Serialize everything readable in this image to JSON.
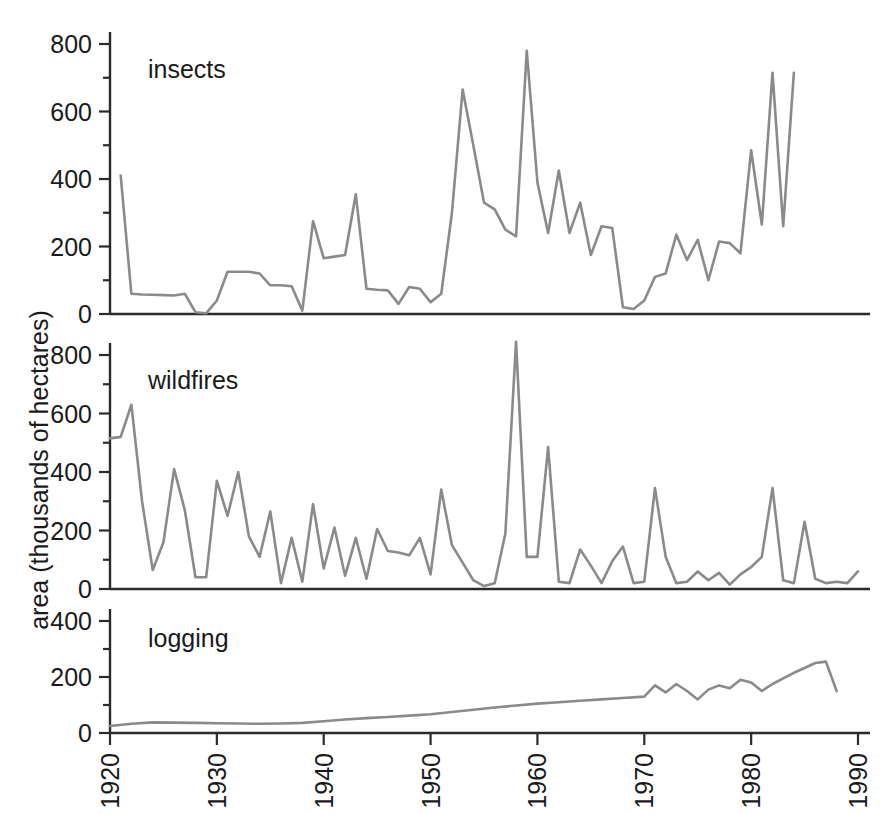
{
  "figure": {
    "y_axis_title": "area (thousands of hectares)",
    "line_color": "#8a8a8a",
    "axis_color": "#2b2b2b",
    "background": "#ffffff"
  },
  "chart_data": {
    "type": "line",
    "title": "",
    "xlabel": "",
    "ylabel": "area (thousands of hectares)",
    "grid": false,
    "legend": "none",
    "xlim": [
      1920,
      1990
    ],
    "x_ticks": [
      "1920",
      "1930",
      "1940",
      "1950",
      "1960",
      "1970",
      "1980",
      "1990"
    ],
    "x_tick_values": [
      1920,
      1930,
      1940,
      1950,
      1960,
      1970,
      1980,
      1990
    ],
    "panels": [
      {
        "name": "insects",
        "label": "insects",
        "ylim": [
          0,
          850
        ],
        "y_ticks": [
          0,
          200,
          400,
          600,
          800
        ],
        "y_tick_labels": [
          "0",
          "200",
          "400",
          "600",
          "800"
        ],
        "y_minor_ticks": [
          100,
          300,
          500,
          700
        ],
        "x": [
          1921,
          1922,
          1923,
          1924,
          1925,
          1926,
          1927,
          1928,
          1929,
          1930,
          1931,
          1932,
          1933,
          1934,
          1935,
          1936,
          1937,
          1938,
          1939,
          1940,
          1941,
          1942,
          1943,
          1944,
          1945,
          1946,
          1947,
          1948,
          1949,
          1950,
          1951,
          1952,
          1953,
          1954,
          1955,
          1956,
          1957,
          1958,
          1959,
          1960,
          1961,
          1962,
          1963,
          1964,
          1965,
          1966,
          1967,
          1968,
          1969,
          1970,
          1971,
          1972,
          1973,
          1974,
          1975,
          1976,
          1977,
          1978,
          1979,
          1980,
          1981,
          1982,
          1983,
          1984,
          1985,
          1986,
          1987,
          1988
        ],
        "values": [
          410,
          60,
          58,
          57,
          56,
          55,
          60,
          5,
          2,
          40,
          125,
          125,
          125,
          120,
          85,
          85,
          82,
          10,
          275,
          165,
          170,
          175,
          355,
          75,
          72,
          70,
          30,
          80,
          75,
          35,
          60,
          300,
          665,
          500,
          330,
          310,
          250,
          230,
          780,
          390,
          240,
          425,
          240,
          330,
          175,
          260,
          255,
          20,
          15,
          40,
          110,
          120,
          235,
          160,
          220,
          100,
          215,
          210,
          180,
          485,
          265,
          715,
          260,
          715
        ]
      },
      {
        "name": "wildfires",
        "label": "wildfires",
        "ylim": [
          0,
          880
        ],
        "y_ticks": [
          0,
          200,
          400,
          600,
          800
        ],
        "y_tick_labels": [
          "0",
          "200",
          "400",
          "600",
          "800"
        ],
        "y_minor_ticks": [
          100,
          300,
          500,
          700
        ],
        "x": [
          1920,
          1921,
          1922,
          1923,
          1924,
          1925,
          1926,
          1927,
          1928,
          1929,
          1930,
          1931,
          1932,
          1933,
          1934,
          1935,
          1936,
          1937,
          1938,
          1939,
          1940,
          1941,
          1942,
          1943,
          1944,
          1945,
          1946,
          1947,
          1948,
          1949,
          1950,
          1951,
          1952,
          1953,
          1954,
          1955,
          1956,
          1957,
          1958,
          1959,
          1960,
          1961,
          1962,
          1963,
          1964,
          1965,
          1966,
          1967,
          1968,
          1969,
          1970,
          1971,
          1972,
          1973,
          1974,
          1975,
          1976,
          1977,
          1978,
          1979,
          1980,
          1981,
          1982,
          1983,
          1984,
          1985,
          1986,
          1987,
          1988,
          1989,
          1990
        ],
        "values": [
          515,
          520,
          630,
          300,
          65,
          160,
          410,
          270,
          40,
          40,
          370,
          250,
          400,
          180,
          110,
          265,
          20,
          175,
          25,
          290,
          70,
          210,
          45,
          175,
          35,
          205,
          130,
          125,
          115,
          175,
          50,
          340,
          150,
          90,
          30,
          10,
          20,
          190,
          845,
          110,
          110,
          485,
          25,
          20,
          135,
          80,
          20,
          95,
          145,
          20,
          25,
          345,
          110,
          20,
          25,
          60,
          30,
          55,
          15,
          50,
          75,
          110,
          345,
          30,
          20,
          230,
          35,
          20,
          25,
          20,
          60
        ]
      },
      {
        "name": "logging",
        "label": "logging",
        "ylim": [
          0,
          430
        ],
        "y_ticks": [
          0,
          200,
          400
        ],
        "y_tick_labels": [
          "0",
          "200",
          "400"
        ],
        "y_minor_ticks": [
          100,
          300
        ],
        "x": [
          1920,
          1922,
          1924,
          1926,
          1928,
          1930,
          1932,
          1934,
          1936,
          1938,
          1940,
          1942,
          1944,
          1946,
          1948,
          1950,
          1952,
          1954,
          1956,
          1958,
          1960,
          1962,
          1964,
          1966,
          1968,
          1970,
          1971,
          1972,
          1973,
          1974,
          1975,
          1976,
          1977,
          1978,
          1979,
          1980,
          1981,
          1982,
          1983,
          1984,
          1985,
          1986,
          1987,
          1988,
          1989,
          1990
        ],
        "values": [
          25,
          33,
          38,
          37,
          36,
          35,
          34,
          33,
          34,
          36,
          42,
          48,
          53,
          57,
          62,
          67,
          75,
          83,
          91,
          98,
          105,
          110,
          115,
          120,
          125,
          130,
          170,
          145,
          175,
          150,
          120,
          155,
          170,
          160,
          190,
          180,
          150,
          175,
          195,
          215,
          232,
          250,
          255,
          150
        ]
      }
    ]
  }
}
